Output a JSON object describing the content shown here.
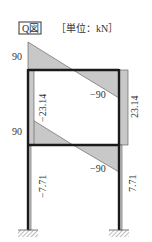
{
  "title": {
    "diagram_name": "Q図",
    "unit_label": "［単位：kN］"
  },
  "diagram": {
    "type": "shear-force-diagram",
    "structure": "two-story single-bay portal frame with fixed supports",
    "members": {
      "top_beam": {
        "left_value": "90",
        "right_value": "-90"
      },
      "lower_beam": {
        "left_value": "90",
        "right_value": "-90"
      },
      "upper_left_column": {
        "value": "-23.14"
      },
      "upper_right_column": {
        "value": "23.14"
      },
      "lower_left_column": {
        "value": "-7.71"
      },
      "lower_right_column": {
        "value": "7.71"
      }
    },
    "labels": {
      "top_beam_left": "90",
      "top_beam_right": "−90",
      "lower_beam_left": "90",
      "lower_beam_right": "−90",
      "upper_left_col": "−23.14",
      "upper_right_col": "23.14",
      "lower_left_col": "−7.71",
      "lower_right_col": "7.71"
    },
    "colors": {
      "frame": "#1a1a1a",
      "diagram_fill": "#c8c8c8",
      "diagram_stroke": "#555555",
      "text": "#333333"
    }
  }
}
